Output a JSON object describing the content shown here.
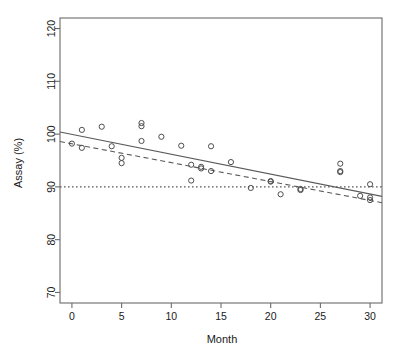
{
  "chart_data": {
    "type": "scatter",
    "title": "",
    "xlabel": "Month",
    "ylabel": "Assay (%)",
    "xlim": [
      -1.2,
      31.2
    ],
    "ylim": [
      68.0,
      122.0
    ],
    "xticks": [
      0,
      5,
      10,
      15,
      20,
      25,
      30
    ],
    "xtick_labels": [
      "0",
      "5",
      "10",
      "15",
      "20",
      "25",
      "30"
    ],
    "yticks": [
      70,
      80,
      90,
      100,
      110,
      120
    ],
    "ytick_labels": [
      "70",
      "80",
      "90",
      "100",
      "110",
      "120"
    ],
    "grid": false,
    "legend": null,
    "marker": "open-circle",
    "points": [
      {
        "x": 0,
        "y": 98.2
      },
      {
        "x": 1,
        "y": 100.8
      },
      {
        "x": 1,
        "y": 97.4
      },
      {
        "x": 3,
        "y": 101.4
      },
      {
        "x": 4,
        "y": 97.7
      },
      {
        "x": 5,
        "y": 95.5
      },
      {
        "x": 5,
        "y": 94.5
      },
      {
        "x": 7,
        "y": 102.1
      },
      {
        "x": 7,
        "y": 101.5
      },
      {
        "x": 7,
        "y": 98.7
      },
      {
        "x": 9,
        "y": 99.5
      },
      {
        "x": 11,
        "y": 97.8
      },
      {
        "x": 12,
        "y": 94.2
      },
      {
        "x": 12,
        "y": 91.2
      },
      {
        "x": 13,
        "y": 93.8
      },
      {
        "x": 13,
        "y": 93.5
      },
      {
        "x": 14,
        "y": 97.7
      },
      {
        "x": 14,
        "y": 93.0
      },
      {
        "x": 16,
        "y": 94.7
      },
      {
        "x": 18,
        "y": 89.8
      },
      {
        "x": 20,
        "y": 91.1
      },
      {
        "x": 20,
        "y": 91.0
      },
      {
        "x": 21,
        "y": 88.6
      },
      {
        "x": 23,
        "y": 89.6
      },
      {
        "x": 23,
        "y": 89.4
      },
      {
        "x": 27,
        "y": 94.4
      },
      {
        "x": 27,
        "y": 93.0
      },
      {
        "x": 27,
        "y": 92.8
      },
      {
        "x": 29,
        "y": 88.3
      },
      {
        "x": 30,
        "y": 90.5
      },
      {
        "x": 30,
        "y": 88.0
      },
      {
        "x": 30,
        "y": 87.5
      }
    ],
    "lines": [
      {
        "name": "regression-fit",
        "style": "solid",
        "x0": -1.2,
        "y0": 100.4,
        "x1": 31.2,
        "y1": 88.2
      },
      {
        "name": "confidence-limit",
        "style": "dashed",
        "x0": -1.2,
        "y0": 98.6,
        "x1": 31.2,
        "y1": 87.0
      },
      {
        "name": "specification-limit",
        "style": "dotted",
        "x0": -1.2,
        "y0": 90.0,
        "x1": 31.2,
        "y1": 90.0
      }
    ]
  },
  "axes": {
    "xlabel": "Month",
    "ylabel": "Assay (%)"
  }
}
